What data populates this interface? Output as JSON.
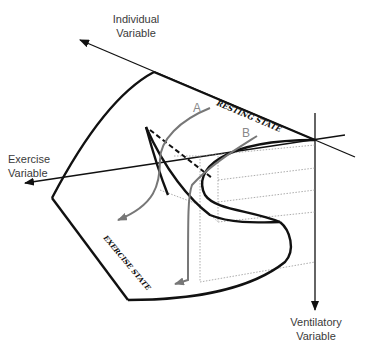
{
  "axes": {
    "individual": {
      "line1": "Individual",
      "line2": "Variable"
    },
    "exercise": {
      "line1": "Exercise",
      "line2": "Variable"
    },
    "ventilatory": {
      "line1": "Ventilatory",
      "line2": "Variable"
    }
  },
  "surface_labels": {
    "resting": "RESTING STATE",
    "exercise": "EXERCISE STATE"
  },
  "paths": {
    "a": "A",
    "b": "B"
  },
  "colors": {
    "line": "#111111",
    "path": "#777777",
    "text": "#3a3a3a"
  }
}
